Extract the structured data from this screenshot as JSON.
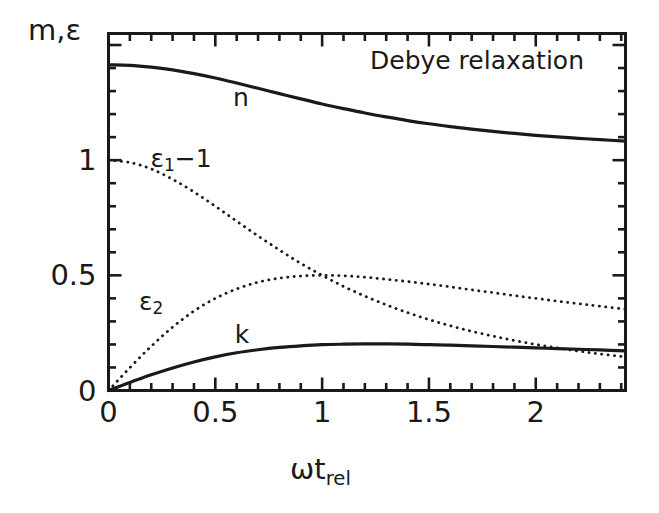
{
  "figure": {
    "background": "#ffffff",
    "ink": "#1a1a1a"
  },
  "annotation": {
    "title": "Debye relaxation"
  },
  "axes": {
    "ylabel": "m,ε",
    "xlabel_main": "ωt",
    "xlabel_sub": "rel",
    "xticks": [
      "0",
      "0.5",
      "1",
      "1.5",
      "2"
    ],
    "yticks": [
      "0",
      "0.5",
      "1"
    ]
  },
  "curve_labels": {
    "n": "n",
    "k": "k",
    "eps1": "ε",
    "eps1_sub": "1",
    "eps1_rest": "−1",
    "eps2": "ε",
    "eps2_sub": "2"
  },
  "chart_data": {
    "type": "line",
    "title": "Debye relaxation",
    "xlabel": "ωt_rel",
    "ylabel": "m,ε",
    "xlim": [
      0,
      2.42
    ],
    "ylim": [
      0,
      1.55
    ],
    "xticks_major": [
      0,
      0.5,
      1,
      1.5,
      2
    ],
    "yticks_major": [
      0,
      0.5,
      1,
      1.5
    ],
    "xtick_minor_step": 0.1,
    "ytick_minor_step": 0.1,
    "grid": false,
    "legend": "inline-labels",
    "tick_direction": "in",
    "series": [
      {
        "name": "n",
        "style": "solid",
        "label_at": {
          "x": 0.62,
          "y": 1.275
        },
        "x": [
          0.0,
          0.1,
          0.2,
          0.3,
          0.4,
          0.5,
          0.6,
          0.7,
          0.8,
          0.9,
          1.0,
          1.1,
          1.2,
          1.3,
          1.4,
          1.5,
          1.6,
          1.7,
          1.8,
          1.9,
          2.0,
          2.1,
          2.2,
          2.3,
          2.42
        ],
        "values": [
          1.414,
          1.412,
          1.404,
          1.392,
          1.376,
          1.357,
          1.335,
          1.312,
          1.289,
          1.266,
          1.244,
          1.224,
          1.205,
          1.188,
          1.172,
          1.158,
          1.146,
          1.135,
          1.125,
          1.116,
          1.108,
          1.101,
          1.095,
          1.089,
          1.083
        ]
      },
      {
        "name": "k",
        "style": "solid",
        "label_at": {
          "x": 0.625,
          "y": 0.245
        },
        "x": [
          0.0,
          0.1,
          0.2,
          0.3,
          0.4,
          0.5,
          0.6,
          0.7,
          0.8,
          0.9,
          1.0,
          1.1,
          1.2,
          1.3,
          1.4,
          1.5,
          1.6,
          1.7,
          1.8,
          1.9,
          2.0,
          2.1,
          2.2,
          2.3,
          2.42
        ],
        "values": [
          0.0,
          0.035,
          0.068,
          0.098,
          0.124,
          0.146,
          0.164,
          0.177,
          0.187,
          0.194,
          0.199,
          0.201,
          0.202,
          0.202,
          0.201,
          0.199,
          0.197,
          0.194,
          0.191,
          0.188,
          0.185,
          0.182,
          0.179,
          0.176,
          0.172
        ]
      },
      {
        "name": "ε₁−1",
        "style": "dotted",
        "label_at": {
          "x": 0.34,
          "y": 1.0
        },
        "x": [
          0.0,
          0.1,
          0.2,
          0.3,
          0.4,
          0.5,
          0.6,
          0.7,
          0.8,
          0.9,
          1.0,
          1.1,
          1.2,
          1.3,
          1.4,
          1.5,
          1.6,
          1.7,
          1.8,
          1.9,
          2.0,
          2.1,
          2.2,
          2.3,
          2.42
        ],
        "values": [
          1.0,
          0.99,
          0.962,
          0.917,
          0.862,
          0.8,
          0.735,
          0.671,
          0.61,
          0.552,
          0.5,
          0.452,
          0.41,
          0.372,
          0.338,
          0.308,
          0.281,
          0.257,
          0.236,
          0.217,
          0.2,
          0.185,
          0.171,
          0.159,
          0.146
        ]
      },
      {
        "name": "ε₂",
        "style": "dotted",
        "label_at": {
          "x": 0.2,
          "y": 0.38
        },
        "x": [
          0.0,
          0.1,
          0.2,
          0.3,
          0.4,
          0.5,
          0.6,
          0.7,
          0.8,
          0.9,
          1.0,
          1.1,
          1.2,
          1.3,
          1.4,
          1.5,
          1.6,
          1.7,
          1.8,
          1.9,
          2.0,
          2.1,
          2.2,
          2.3,
          2.42
        ],
        "values": [
          0.0,
          0.099,
          0.192,
          0.275,
          0.345,
          0.4,
          0.441,
          0.47,
          0.488,
          0.497,
          0.5,
          0.498,
          0.492,
          0.483,
          0.473,
          0.462,
          0.45,
          0.437,
          0.425,
          0.412,
          0.4,
          0.388,
          0.377,
          0.366,
          0.353
        ]
      }
    ]
  }
}
